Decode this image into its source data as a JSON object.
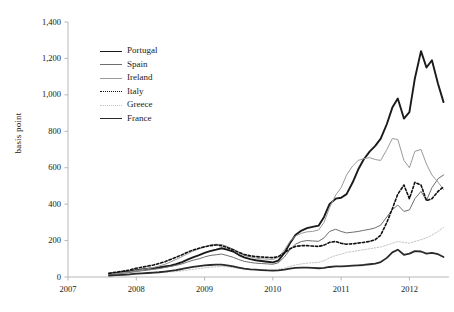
{
  "chart_data": {
    "type": "line",
    "title": "",
    "xlabel": "",
    "ylabel": "basis point",
    "xlim": [
      2007.0,
      2012.58
    ],
    "ylim": [
      0,
      1400
    ],
    "grid": false,
    "legend_position": "upper-left-inside",
    "yticks": [
      "0",
      "200",
      "400",
      "600",
      "800",
      "1,000",
      "1,200",
      "1,400"
    ],
    "ytick_values": [
      0,
      200,
      400,
      600,
      800,
      1000,
      1200,
      1400
    ],
    "xticks": [
      "2007",
      "2008",
      "2009",
      "2010",
      "2011",
      "2012"
    ],
    "xtick_values": [
      2007,
      2008,
      2009,
      2010,
      2011,
      2012
    ],
    "series": [
      {
        "name": "Portugal",
        "color": "#1a1a1a",
        "width": 1.9,
        "dash": "none",
        "x": [
          2007.6,
          2007.7,
          2007.8,
          2007.9,
          2008.0,
          2008.08,
          2008.17,
          2008.25,
          2008.33,
          2008.42,
          2008.5,
          2008.58,
          2008.67,
          2008.75,
          2008.83,
          2008.92,
          2009.0,
          2009.08,
          2009.17,
          2009.25,
          2009.33,
          2009.42,
          2009.5,
          2009.58,
          2009.67,
          2009.75,
          2009.83,
          2009.92,
          2010.0,
          2010.08,
          2010.17,
          2010.25,
          2010.33,
          2010.42,
          2010.5,
          2010.58,
          2010.67,
          2010.75,
          2010.83,
          2010.92,
          2011.0,
          2011.08,
          2011.17,
          2011.25,
          2011.33,
          2011.42,
          2011.5,
          2011.58,
          2011.67,
          2011.75,
          2011.83,
          2011.92,
          2012.0,
          2012.08,
          2012.17,
          2012.25,
          2012.33,
          2012.42,
          2012.5
        ],
        "y": [
          18,
          22,
          26,
          30,
          38,
          42,
          45,
          48,
          52,
          58,
          62,
          70,
          82,
          95,
          108,
          120,
          132,
          142,
          150,
          158,
          150,
          140,
          122,
          108,
          98,
          92,
          88,
          84,
          80,
          90,
          132,
          185,
          230,
          255,
          268,
          275,
          282,
          330,
          400,
          430,
          435,
          455,
          520,
          590,
          645,
          690,
          720,
          760,
          840,
          930,
          980,
          870,
          905,
          1090,
          1240,
          1150,
          1190,
          1060,
          960
        ]
      },
      {
        "name": "Spain",
        "color": "#6e6e6e",
        "width": 1.0,
        "dash": "none",
        "x": [
          2007.6,
          2007.7,
          2007.8,
          2007.9,
          2008.0,
          2008.08,
          2008.17,
          2008.25,
          2008.33,
          2008.42,
          2008.5,
          2008.58,
          2008.67,
          2008.75,
          2008.83,
          2008.92,
          2009.0,
          2009.08,
          2009.17,
          2009.25,
          2009.33,
          2009.42,
          2009.5,
          2009.58,
          2009.67,
          2009.75,
          2009.83,
          2009.92,
          2010.0,
          2010.08,
          2010.17,
          2010.25,
          2010.33,
          2010.42,
          2010.5,
          2010.58,
          2010.67,
          2010.75,
          2010.83,
          2010.92,
          2011.0,
          2011.08,
          2011.17,
          2011.25,
          2011.33,
          2011.42,
          2011.5,
          2011.58,
          2011.67,
          2011.75,
          2011.83,
          2011.92,
          2012.0,
          2012.08,
          2012.17,
          2012.25,
          2012.33,
          2012.42,
          2012.5
        ],
        "y": [
          14,
          18,
          20,
          24,
          30,
          34,
          38,
          42,
          46,
          52,
          58,
          64,
          72,
          82,
          92,
          100,
          110,
          118,
          122,
          126,
          118,
          108,
          96,
          86,
          80,
          76,
          74,
          72,
          70,
          78,
          110,
          150,
          180,
          195,
          200,
          198,
          196,
          215,
          250,
          262,
          250,
          242,
          246,
          250,
          256,
          262,
          270,
          285,
          330,
          370,
          395,
          360,
          368,
          430,
          470,
          420,
          490,
          540,
          560
        ]
      },
      {
        "name": "Ireland",
        "color": "#9a9a9a",
        "width": 1.0,
        "dash": "none",
        "x": [
          2007.6,
          2007.7,
          2007.8,
          2007.9,
          2008.0,
          2008.08,
          2008.17,
          2008.25,
          2008.33,
          2008.42,
          2008.5,
          2008.58,
          2008.67,
          2008.75,
          2008.83,
          2008.92,
          2009.0,
          2009.08,
          2009.17,
          2009.25,
          2009.33,
          2009.42,
          2009.5,
          2009.58,
          2009.67,
          2009.75,
          2009.83,
          2009.92,
          2010.0,
          2010.08,
          2010.17,
          2010.25,
          2010.33,
          2010.42,
          2010.5,
          2010.58,
          2010.67,
          2010.75,
          2010.83,
          2010.92,
          2011.0,
          2011.08,
          2011.17,
          2011.25,
          2011.33,
          2011.42,
          2011.5,
          2011.58,
          2011.67,
          2011.75,
          2011.83,
          2011.92,
          2012.0,
          2012.08,
          2012.17,
          2012.25,
          2012.33,
          2012.42,
          2012.5
        ],
        "y": [
          16,
          20,
          24,
          28,
          36,
          40,
          46,
          52,
          60,
          70,
          82,
          96,
          112,
          128,
          142,
          155,
          165,
          175,
          180,
          178,
          168,
          152,
          132,
          118,
          110,
          104,
          100,
          98,
          96,
          108,
          148,
          195,
          225,
          240,
          248,
          250,
          258,
          300,
          380,
          450,
          490,
          560,
          610,
          640,
          650,
          655,
          645,
          640,
          700,
          760,
          755,
          640,
          600,
          690,
          700,
          620,
          560,
          520,
          480
        ]
      },
      {
        "name": "Italy",
        "color": "#111111",
        "width": 1.6,
        "dash": "2.4,2.0",
        "x": [
          2007.6,
          2007.7,
          2007.8,
          2007.9,
          2008.0,
          2008.08,
          2008.17,
          2008.25,
          2008.33,
          2008.42,
          2008.5,
          2008.58,
          2008.67,
          2008.75,
          2008.83,
          2008.92,
          2009.0,
          2009.08,
          2009.17,
          2009.25,
          2009.33,
          2009.42,
          2009.5,
          2009.58,
          2009.67,
          2009.75,
          2009.83,
          2009.92,
          2010.0,
          2010.08,
          2010.17,
          2010.25,
          2010.33,
          2010.42,
          2010.5,
          2010.58,
          2010.67,
          2010.75,
          2010.83,
          2010.92,
          2011.0,
          2011.08,
          2011.17,
          2011.25,
          2011.33,
          2011.42,
          2011.5,
          2011.58,
          2011.67,
          2011.75,
          2011.83,
          2011.92,
          2012.0,
          2012.08,
          2012.17,
          2012.25,
          2012.33,
          2012.42,
          2012.5
        ],
        "y": [
          20,
          26,
          32,
          38,
          48,
          54,
          60,
          66,
          74,
          84,
          96,
          108,
          122,
          136,
          148,
          158,
          166,
          172,
          176,
          172,
          162,
          150,
          136,
          124,
          116,
          112,
          110,
          108,
          106,
          112,
          132,
          155,
          168,
          172,
          172,
          170,
          168,
          175,
          190,
          195,
          185,
          180,
          182,
          186,
          190,
          196,
          205,
          230,
          300,
          375,
          455,
          505,
          430,
          520,
          505,
          420,
          430,
          470,
          495
        ]
      },
      {
        "name": "Greece",
        "color": "#c4c4c4",
        "width": 1.0,
        "dash": "1.6,1.6",
        "x": [
          2007.6,
          2007.7,
          2007.8,
          2007.9,
          2008.0,
          2008.08,
          2008.17,
          2008.25,
          2008.33,
          2008.42,
          2008.5,
          2008.58,
          2008.67,
          2008.75,
          2008.83,
          2008.92,
          2009.0,
          2009.08,
          2009.17,
          2009.25,
          2009.33,
          2009.42,
          2009.5,
          2009.58,
          2009.67,
          2009.75,
          2009.83,
          2009.92,
          2010.0,
          2010.08,
          2010.17,
          2010.25,
          2010.33,
          2010.42,
          2010.5,
          2010.58,
          2010.67,
          2010.75,
          2010.83,
          2010.92,
          2011.0,
          2011.08,
          2011.17,
          2011.25,
          2011.33,
          2011.42,
          2011.5,
          2011.58,
          2011.67,
          2011.75,
          2011.83,
          2011.92,
          2012.0,
          2012.08,
          2012.17,
          2012.25,
          2012.33,
          2012.42,
          2012.5
        ],
        "y": [
          6,
          8,
          10,
          12,
          16,
          18,
          20,
          22,
          24,
          26,
          28,
          30,
          34,
          38,
          42,
          46,
          50,
          54,
          56,
          58,
          56,
          52,
          48,
          44,
          42,
          40,
          40,
          40,
          40,
          42,
          48,
          58,
          66,
          72,
          76,
          78,
          80,
          90,
          105,
          118,
          125,
          135,
          140,
          145,
          150,
          155,
          160,
          165,
          175,
          185,
          195,
          190,
          185,
          195,
          205,
          215,
          230,
          250,
          272
        ]
      },
      {
        "name": "France",
        "color": "#2a2a2a",
        "width": 1.8,
        "dash": "none",
        "x": [
          2007.6,
          2007.7,
          2007.8,
          2007.9,
          2008.0,
          2008.08,
          2008.17,
          2008.25,
          2008.33,
          2008.42,
          2008.5,
          2008.58,
          2008.67,
          2008.75,
          2008.83,
          2008.92,
          2009.0,
          2009.08,
          2009.17,
          2009.25,
          2009.33,
          2009.42,
          2009.5,
          2009.58,
          2009.67,
          2009.75,
          2009.83,
          2009.92,
          2010.0,
          2010.08,
          2010.17,
          2010.25,
          2010.33,
          2010.42,
          2010.5,
          2010.58,
          2010.67,
          2010.75,
          2010.83,
          2010.92,
          2011.0,
          2011.08,
          2011.17,
          2011.25,
          2011.33,
          2011.42,
          2011.5,
          2011.58,
          2011.67,
          2011.75,
          2011.83,
          2011.92,
          2012.0,
          2012.08,
          2012.17,
          2012.25,
          2012.33,
          2012.42,
          2012.5
        ],
        "y": [
          8,
          10,
          12,
          14,
          18,
          20,
          22,
          24,
          26,
          30,
          34,
          38,
          44,
          50,
          56,
          60,
          64,
          66,
          68,
          68,
          64,
          58,
          52,
          46,
          42,
          40,
          38,
          36,
          35,
          36,
          40,
          46,
          50,
          52,
          52,
          50,
          48,
          50,
          55,
          58,
          58,
          60,
          62,
          64,
          66,
          70,
          74,
          82,
          105,
          135,
          150,
          122,
          128,
          142,
          140,
          128,
          132,
          125,
          110
        ]
      }
    ]
  },
  "legend": {
    "items": [
      {
        "label": "Portugal"
      },
      {
        "label": "Spain"
      },
      {
        "label": "Ireland"
      },
      {
        "label": "Italy"
      },
      {
        "label": "Greece"
      },
      {
        "label": "France"
      }
    ]
  }
}
